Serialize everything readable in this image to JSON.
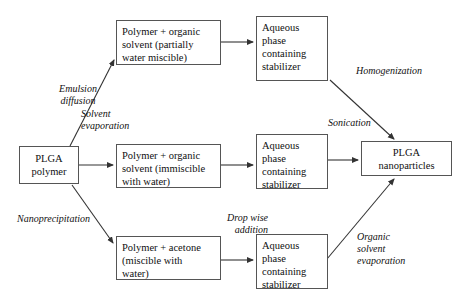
{
  "diagram": {
    "nodes": {
      "plga_polymer": "PLGA\npolymer",
      "polymer_partially_miscible": "Polymer + organic\nsolvent (partially\nwater miscible)",
      "polymer_immiscible": "Polymer + organic\nsolvent (immiscible\nwith water)",
      "polymer_acetone": "Polymer + acetone\n(miscible with\nwater)",
      "aqueous_top": "Aqueous\nphase\ncontaining\nstabilizer",
      "aqueous_middle": "Aqueous\nphase\ncontaining\nstabilizer",
      "aqueous_bottom": "Aqueous\nphase\ncontaining\nstabilizer",
      "plga_nanoparticles": "PLGA\nnanoparticles"
    },
    "labels": {
      "emulsion_diffusion": "Emulsion\ndiffusion",
      "solvent_evaporation": "Solvent\nevaporation",
      "nanoprecipitation": "Nanoprecipitation",
      "homogenization": "Homogenization",
      "sonication": "Sonication",
      "drop_wise_addition": "Drop wise\naddition",
      "organic_solvent_evaporation": "Organic\nsolvent\nevaporation"
    },
    "colors": {
      "box_border": "#555555",
      "arrow": "#333333",
      "background": "#ffffff",
      "text": "#101010"
    }
  }
}
